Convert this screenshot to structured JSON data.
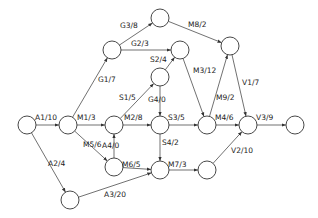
{
  "diagram": {
    "type": "activity-network",
    "nodes": [
      {
        "id": "n1",
        "x": 27,
        "y": 125
      },
      {
        "id": "n2",
        "x": 68,
        "y": 125
      },
      {
        "id": "n3",
        "x": 112,
        "y": 50
      },
      {
        "id": "n4",
        "x": 160,
        "y": 18
      },
      {
        "id": "n5",
        "x": 180,
        "y": 50
      },
      {
        "id": "n6",
        "x": 160,
        "y": 77
      },
      {
        "id": "n7",
        "x": 114,
        "y": 125
      },
      {
        "id": "n8",
        "x": 160,
        "y": 125
      },
      {
        "id": "n9",
        "x": 207,
        "y": 125
      },
      {
        "id": "n10",
        "x": 230,
        "y": 46
      },
      {
        "id": "n11",
        "x": 248,
        "y": 125
      },
      {
        "id": "n12",
        "x": 295,
        "y": 125
      },
      {
        "id": "n13",
        "x": 114,
        "y": 167
      },
      {
        "id": "n14",
        "x": 160,
        "y": 170
      },
      {
        "id": "n15",
        "x": 207,
        "y": 170
      },
      {
        "id": "n16",
        "x": 70,
        "y": 200
      }
    ],
    "edges": [
      {
        "from": "n1",
        "to": "n2",
        "label": "A1/10",
        "lx": 35,
        "ly": 120
      },
      {
        "from": "n1",
        "to": "n16",
        "label": "A2/4",
        "lx": 48,
        "ly": 166
      },
      {
        "from": "n16",
        "to": "n14",
        "label": "A3/20",
        "lx": 104,
        "ly": 197
      },
      {
        "from": "n2",
        "to": "n3",
        "label": "G1/7",
        "lx": 98,
        "ly": 82
      },
      {
        "from": "n3",
        "to": "n4",
        "label": "G3/8",
        "lx": 120,
        "ly": 28
      },
      {
        "from": "n3",
        "to": "n5",
        "label": "G2/3",
        "lx": 131,
        "ly": 46
      },
      {
        "from": "n4",
        "to": "n10",
        "label": "M8/2",
        "lx": 188,
        "ly": 27
      },
      {
        "from": "n2",
        "to": "n7",
        "label": "M1/3",
        "lx": 77,
        "ly": 120
      },
      {
        "from": "n2",
        "to": "n13",
        "label": "M5/6",
        "lx": 83,
        "ly": 147
      },
      {
        "from": "n7",
        "to": "n8",
        "label": "M2/8",
        "lx": 124,
        "ly": 120
      },
      {
        "from": "n13",
        "to": "n7",
        "label": "A4/0",
        "lx": 102,
        "ly": 148
      },
      {
        "from": "n13",
        "to": "n14",
        "label": "M6/5",
        "lx": 122,
        "ly": 167
      },
      {
        "from": "n7",
        "to": "n6",
        "label": "S1/5",
        "lx": 119,
        "ly": 100
      },
      {
        "from": "n6",
        "to": "n5",
        "label": "S2/4",
        "lx": 150,
        "ly": 62
      },
      {
        "from": "n6",
        "to": "n8",
        "label": "G4/0",
        "lx": 148,
        "ly": 102
      },
      {
        "from": "n5",
        "to": "n9",
        "label": "M3/12",
        "lx": 193,
        "ly": 73
      },
      {
        "from": "n8",
        "to": "n9",
        "label": "S3/5",
        "lx": 168,
        "ly": 120
      },
      {
        "from": "n8",
        "to": "n14",
        "label": "S4/2",
        "lx": 162,
        "ly": 145
      },
      {
        "from": "n9",
        "to": "n10",
        "label": "M9/2",
        "lx": 216,
        "ly": 100
      },
      {
        "from": "n10",
        "to": "n11",
        "label": "V1/7",
        "lx": 242,
        "ly": 85
      },
      {
        "from": "n9",
        "to": "n11",
        "label": "M4/6",
        "lx": 215,
        "ly": 120
      },
      {
        "from": "n14",
        "to": "n15",
        "label": "M7/3",
        "lx": 168,
        "ly": 167
      },
      {
        "from": "n15",
        "to": "n11",
        "label": "V2/10",
        "lx": 231,
        "ly": 153
      },
      {
        "from": "n11",
        "to": "n12",
        "label": "V3/9",
        "lx": 256,
        "ly": 120
      }
    ],
    "colors": {
      "stroke": "#333333",
      "background": "#ffffff",
      "text": "#222222"
    }
  }
}
